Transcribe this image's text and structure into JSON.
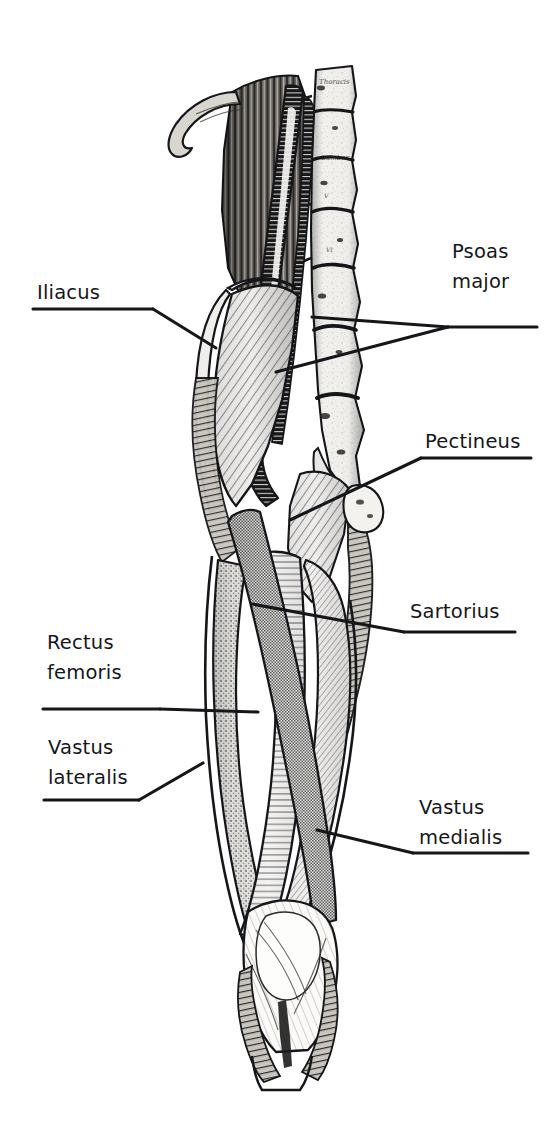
{
  "figure": {
    "style": "black-and-white engraving with line-hatched muscle overlays",
    "background_color": "#ffffff",
    "ink_color": "#15161a",
    "plate_inscriptions": [
      {
        "name": "vertebra-inscription-thoracis",
        "text": "Thoracis"
      },
      {
        "name": "vertebra-inscription-lumborum",
        "text": "Lumbor."
      }
    ]
  },
  "labels": [
    {
      "id": "iliacus",
      "side": "left",
      "lines": [
        "Iliacus"
      ],
      "x": 37,
      "y": 278,
      "underline": {
        "x1": 33,
        "y1": 309,
        "x2": 153,
        "y2": 309
      },
      "leaders": [
        {
          "name": "leader-iliacus",
          "points": "153,309 216,348"
        }
      ]
    },
    {
      "id": "psoas-major",
      "side": "right",
      "lines": [
        "Psoas",
        "major"
      ],
      "x": 452,
      "y": 237,
      "underline": {
        "x1": 448,
        "y1": 327,
        "x2": 537,
        "y2": 327
      },
      "leaders": [
        {
          "name": "leader-psoas-major-upper",
          "points": "448,327 312,317"
        },
        {
          "name": "leader-psoas-major-lower",
          "points": "448,327 276,372"
        }
      ]
    },
    {
      "id": "pectineus",
      "side": "right",
      "lines": [
        "Pectineus"
      ],
      "x": 425,
      "y": 427,
      "underline": {
        "x1": 421,
        "y1": 458,
        "x2": 531,
        "y2": 458
      },
      "leaders": [
        {
          "name": "leader-pectineus",
          "points": "421,458 290,520"
        }
      ]
    },
    {
      "id": "sartorius",
      "side": "right",
      "lines": [
        "Sartorius"
      ],
      "x": 410,
      "y": 597,
      "underline": {
        "x1": 404,
        "y1": 632,
        "x2": 515,
        "y2": 632
      },
      "leaders": [
        {
          "name": "leader-sartorius",
          "points": "404,632 252,604"
        }
      ]
    },
    {
      "id": "rectus-femoris",
      "side": "left",
      "lines": [
        "Rectus",
        "femoris"
      ],
      "x": 47,
      "y": 628,
      "underline": {
        "x1": 43,
        "y1": 709,
        "x2": 160,
        "y2": 709
      },
      "leaders": [
        {
          "name": "leader-rectus-femoris",
          "points": "160,709 258,712"
        }
      ]
    },
    {
      "id": "vastus-lateralis",
      "side": "left",
      "lines": [
        "Vastus",
        "lateralis"
      ],
      "x": 48,
      "y": 733,
      "underline": {
        "x1": 44,
        "y1": 800,
        "x2": 139,
        "y2": 800
      },
      "leaders": [
        {
          "name": "leader-vastus-lateralis",
          "points": "139,800 203,763"
        }
      ]
    },
    {
      "id": "vastus-medialis",
      "side": "right",
      "lines": [
        "Vastus",
        "medialis"
      ],
      "x": 419,
      "y": 793,
      "underline": {
        "x1": 413,
        "y1": 853,
        "x2": 528,
        "y2": 853
      },
      "leaders": [
        {
          "name": "leader-vastus-medialis",
          "points": "413,853 317,830"
        }
      ]
    }
  ],
  "structures": [
    {
      "id": "psoas-major",
      "label": "Psoas major",
      "texture": "dense dark horizontal hatch",
      "tone": "#3a3a3a"
    },
    {
      "id": "iliacus",
      "label": "Iliacus",
      "texture": "diagonal hatch",
      "tone": "#b9b9b9"
    },
    {
      "id": "pectineus",
      "label": "Pectineus",
      "texture": "diagonal hatch",
      "tone": "#c2c2c2"
    },
    {
      "id": "sartorius",
      "label": "Sartorius",
      "texture": "fine stipple / checker",
      "tone": "#8f8f8f"
    },
    {
      "id": "rectus-femoris",
      "label": "Rectus femoris",
      "texture": "horizontal line hatch",
      "tone": "#cfcfcf"
    },
    {
      "id": "vastus-lateralis",
      "label": "Vastus lateralis",
      "texture": "coarse stipple",
      "tone": "#b5b5b5"
    },
    {
      "id": "vastus-medialis",
      "label": "Vastus medialis",
      "texture": "fine diagonal hatch",
      "tone": "#c6c6c6"
    },
    {
      "id": "lumbar-spine",
      "label": "Lumbar vertebrae",
      "texture": "engraved bone",
      "tone": "#f2f2f2"
    },
    {
      "id": "iliac-crest",
      "label": "Iliac crest",
      "texture": "engraved bone",
      "tone": "#e4e4e4"
    },
    {
      "id": "patella-knee",
      "label": "Knee / patella",
      "texture": "engraved tendon",
      "tone": "#fafafa"
    }
  ]
}
